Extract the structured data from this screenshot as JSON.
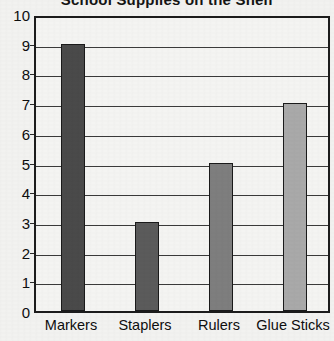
{
  "chart_data": {
    "type": "bar",
    "title": "School Supplies on the Shelf",
    "xlabel": "",
    "ylabel": "",
    "categories": [
      "Markers",
      "Staplers",
      "Rulers",
      "Glue Sticks"
    ],
    "values": [
      9,
      3,
      5,
      7
    ],
    "ylim": [
      0,
      10
    ],
    "ytick_labels": [
      "0",
      "1",
      "2",
      "3",
      "4",
      "5",
      "6",
      "7",
      "8",
      "9",
      "10"
    ],
    "ytick_values": [
      0,
      1,
      2,
      3,
      4,
      5,
      6,
      7,
      8,
      9,
      10
    ],
    "grid": true,
    "legend": false,
    "bar_colors": [
      "#4a4a4a",
      "#5b5b5b",
      "#7e7e7e",
      "#a9a9a9"
    ],
    "series": [
      {
        "name": "Count",
        "values": [
          9,
          3,
          5,
          7
        ]
      }
    ]
  },
  "style": {
    "background": "#f2f2f0",
    "plot_background": "#f4f4f2",
    "axis_color": "#1c1c1c",
    "grid_color": "#3a3a3a",
    "text_color": "#0e0e0e"
  }
}
